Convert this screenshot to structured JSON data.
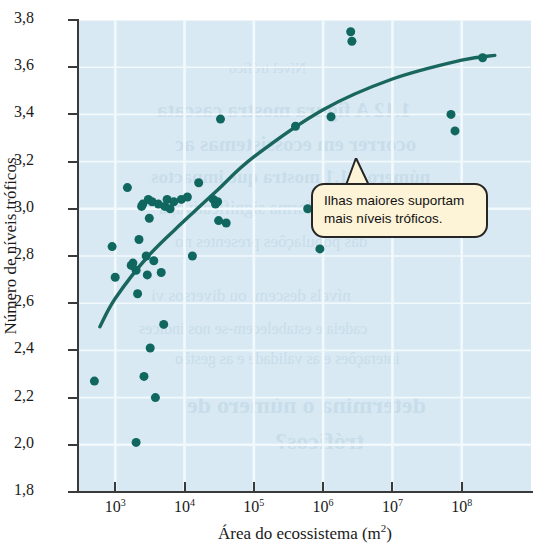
{
  "chart_data": {
    "type": "scatter",
    "title": "",
    "xlabel": "Área do ecossistema (m²)",
    "ylabel": "Número de níveis tróficos",
    "xscale": "log",
    "xlim": [
      300,
      1000000000
    ],
    "ylim": [
      1.8,
      3.8
    ],
    "grid": true,
    "legend": "none",
    "x_tick_labels": [
      "10³",
      "10⁴",
      "10⁵",
      "10⁶",
      "10⁷",
      "10⁸"
    ],
    "x_tick_values": [
      1000,
      10000,
      100000,
      1000000,
      10000000,
      100000000
    ],
    "y_tick_labels": [
      "1,8",
      "2,0",
      "2,2",
      "2,4",
      "2,6",
      "2,8",
      "3,0",
      "3,2",
      "3,4",
      "3,6",
      "3,8"
    ],
    "y_tick_values": [
      1.8,
      2.0,
      2.2,
      2.4,
      2.6,
      2.8,
      3.0,
      3.2,
      3.4,
      3.6,
      3.8
    ],
    "marker_color": "#10675f",
    "marker_size": 9,
    "points": [
      {
        "x": 500,
        "y": 2.27
      },
      {
        "x": 900,
        "y": 2.84
      },
      {
        "x": 1000,
        "y": 2.71
      },
      {
        "x": 1500,
        "y": 3.09
      },
      {
        "x": 1700,
        "y": 2.76
      },
      {
        "x": 1800,
        "y": 2.77
      },
      {
        "x": 2000,
        "y": 2.74
      },
      {
        "x": 2000,
        "y": 2.01
      },
      {
        "x": 2100,
        "y": 2.64
      },
      {
        "x": 2200,
        "y": 2.87
      },
      {
        "x": 2400,
        "y": 3.01
      },
      {
        "x": 2500,
        "y": 3.02
      },
      {
        "x": 2600,
        "y": 2.29
      },
      {
        "x": 2800,
        "y": 2.8
      },
      {
        "x": 2900,
        "y": 2.72
      },
      {
        "x": 3000,
        "y": 3.04
      },
      {
        "x": 3100,
        "y": 2.96
      },
      {
        "x": 3200,
        "y": 2.41
      },
      {
        "x": 3400,
        "y": 3.03
      },
      {
        "x": 3600,
        "y": 2.78
      },
      {
        "x": 3800,
        "y": 2.2
      },
      {
        "x": 4200,
        "y": 3.02
      },
      {
        "x": 4600,
        "y": 2.73
      },
      {
        "x": 5000,
        "y": 2.51
      },
      {
        "x": 5200,
        "y": 3.01
      },
      {
        "x": 5600,
        "y": 3.04
      },
      {
        "x": 6200,
        "y": 3.0
      },
      {
        "x": 7000,
        "y": 3.03
      },
      {
        "x": 9000,
        "y": 3.04
      },
      {
        "x": 11000,
        "y": 3.05
      },
      {
        "x": 13000,
        "y": 2.8
      },
      {
        "x": 16000,
        "y": 3.11
      },
      {
        "x": 26000,
        "y": 3.04
      },
      {
        "x": 28000,
        "y": 3.02
      },
      {
        "x": 30000,
        "y": 3.03
      },
      {
        "x": 31000,
        "y": 2.95
      },
      {
        "x": 33000,
        "y": 3.38
      },
      {
        "x": 40000,
        "y": 2.94
      },
      {
        "x": 400000,
        "y": 3.35
      },
      {
        "x": 900000,
        "y": 2.83
      },
      {
        "x": 1300000,
        "y": 3.39
      },
      {
        "x": 2500000,
        "y": 3.75
      },
      {
        "x": 2600000,
        "y": 3.71
      },
      {
        "x": 70000000,
        "y": 3.4
      },
      {
        "x": 80000000,
        "y": 3.33
      },
      {
        "x": 200000000,
        "y": 3.64
      },
      {
        "x": 600000,
        "y": 3.0
      }
    ],
    "fit_curve": {
      "label": "curva ajustada",
      "color": "#19665e",
      "points": [
        {
          "x": 600,
          "y": 2.5
        },
        {
          "x": 1000,
          "y": 2.62
        },
        {
          "x": 3000,
          "y": 2.8
        },
        {
          "x": 10000,
          "y": 2.95
        },
        {
          "x": 30000,
          "y": 3.08
        },
        {
          "x": 100000,
          "y": 3.22
        },
        {
          "x": 1000000,
          "y": 3.42
        },
        {
          "x": 10000000,
          "y": 3.55
        },
        {
          "x": 100000000,
          "y": 3.63
        },
        {
          "x": 300000000,
          "y": 3.65
        }
      ]
    },
    "annotations": [
      {
        "name": "callout",
        "line1": "Ilhas maiores suportam",
        "line2": "mais níveis tróficos.",
        "background": "#fdf4d8",
        "border": "#262626"
      }
    ]
  },
  "axes": {
    "y_title": "Número de níveis tróficos",
    "x_title_main": "Área do ecossistema (m",
    "x_title_sup": "2",
    "x_title_end": ")"
  },
  "colors": {
    "plot_background": "#d9e9f3",
    "gridline": "#f2f9fc",
    "axis": "#3a3a3a",
    "marker": "#10675f",
    "curve": "#19665e"
  },
  "bleed_text": [
    "Nível trófico",
    "1.12 A figura mostra cascata",
    "ocorrer em ecossistemas ac",
    "número 2.1.1 mostra que impactos",
    "modificar, de forma significativa, a",
    "das populações presentes no",
    "nívels descem, ou diversos vi",
    "cadeia e estabelecem-se nos indices",
    "interações e as validade e as gestão",
    "determina o número de",
    "tróficos?"
  ]
}
